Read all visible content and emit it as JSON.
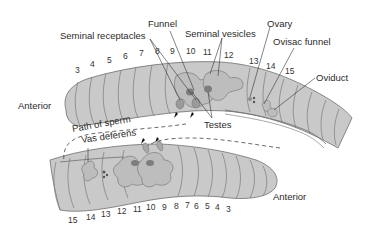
{
  "diagram": {
    "colors": {
      "body_fill": "#c9c9c9",
      "body_stroke": "#6e6e6e",
      "organ_fill": "#b5b5b5",
      "organ_dark": "#7d7d7d",
      "label_text": "#2b2b2b",
      "leader_line": "#333333",
      "background": "#ffffff"
    },
    "labels": {
      "funnel": "Funnel",
      "seminal_receptacles": "Seminal receptacles",
      "seminal_vesicles": "Seminal vesicles",
      "ovary": "Ovary",
      "ovisac_funnel": "Ovisac funnel",
      "oviduct": "Oviduct",
      "testes": "Testes",
      "anterior_top": "Anterior",
      "anterior_bottom": "Anterior",
      "path_of_sperm": "Path of sperm",
      "vas_deferens": "Vas deferens"
    },
    "top_worm_segments": [
      "3",
      "4",
      "5",
      "6",
      "7",
      "8",
      "9",
      "10",
      "11",
      "12",
      "13",
      "14",
      "15"
    ],
    "bottom_worm_segments": [
      "15",
      "14",
      "13",
      "12",
      "11",
      "10",
      "9",
      "8",
      "7",
      "6",
      "5",
      "4",
      "3"
    ]
  }
}
